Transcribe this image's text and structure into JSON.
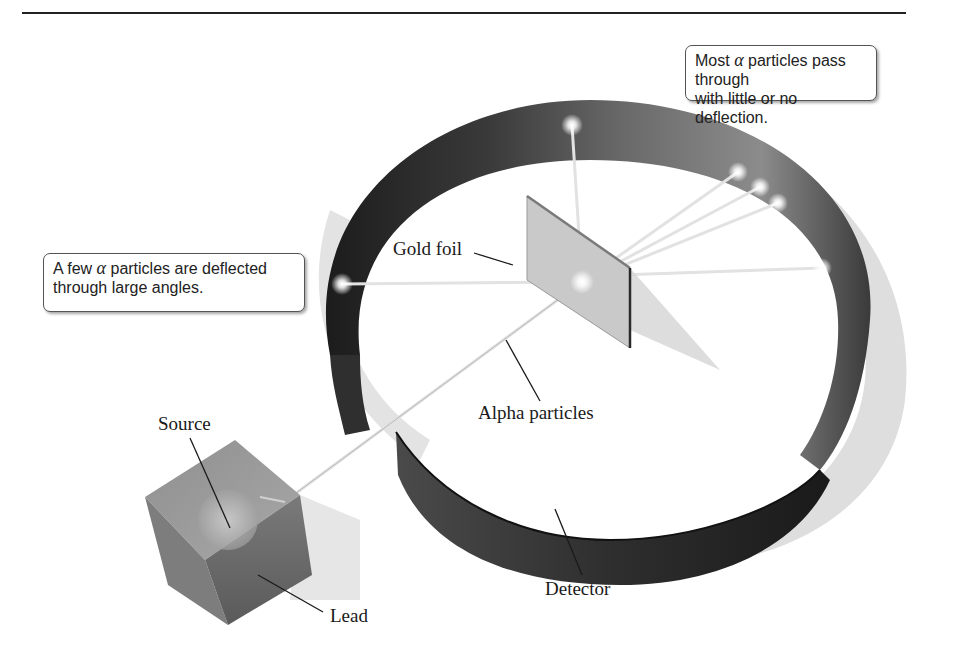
{
  "callouts": {
    "most": {
      "prefix": "Most ",
      "symbol": "α",
      "line1_suffix": " particles pass through",
      "line2": "with little or no deflection."
    },
    "few": {
      "prefix": "A few ",
      "symbol": "α",
      "line1_suffix": " particles are deflected",
      "line2": "through large angles."
    }
  },
  "labels": {
    "gold_foil": "Gold foil",
    "alpha_particles": "Alpha particles",
    "source": "Source",
    "lead": "Lead",
    "detector": "Detector"
  },
  "colors": {
    "ring_dark": "#2b2b2b",
    "ring_mid": "#6e6e6e",
    "ring_light": "#a9a9a9",
    "shadow": "#dcdcdc",
    "foil": "#c4c4c4",
    "cube": "#8a8a8a",
    "beam": "#e8e8e8"
  }
}
